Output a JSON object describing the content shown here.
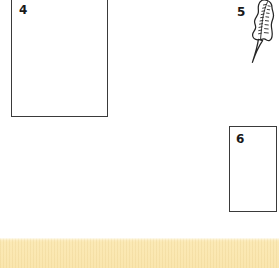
{
  "page": {
    "background_color": "#ffffff",
    "width": 279,
    "height": 268,
    "kind": "worksheet-page-fragment"
  },
  "items": [
    {
      "id": "item-4",
      "number": "4",
      "type": "answer-box",
      "note": "large empty rectangle, cropped at top edge of page"
    },
    {
      "id": "item-5",
      "number": "5",
      "type": "line-drawing",
      "subject": "feather quill pen",
      "icon": "feather-icon"
    },
    {
      "id": "item-6",
      "number": "6",
      "type": "answer-box",
      "note": "small empty rectangle"
    }
  ],
  "drawing": {
    "stroke_color": "#262626",
    "fill_color": "#ffffff"
  },
  "box_style": {
    "border_color": "#3a3a3a",
    "fill_color": "#ffffff"
  },
  "bottom_band": {
    "name": "page-footer-band",
    "color": "#fae6ae",
    "highlight_color": "#fdf2cf",
    "texture": "fine vertical weave"
  }
}
